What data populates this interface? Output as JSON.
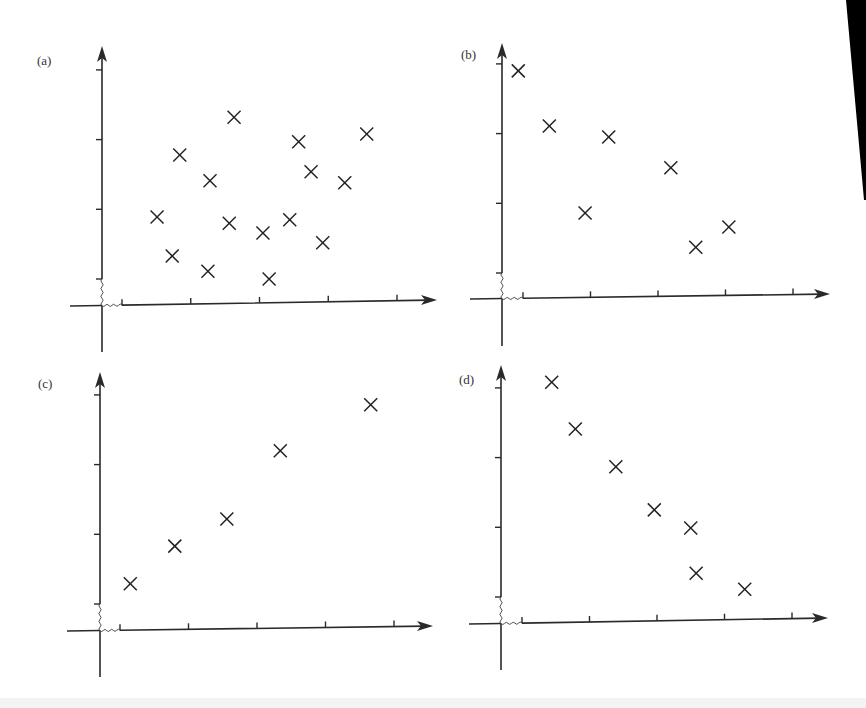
{
  "figure": {
    "edge_shadow": true
  },
  "chart_data": [
    {
      "panel": "(a)",
      "type": "scatter",
      "title": "",
      "xlabel": "",
      "ylabel": "",
      "grid": false,
      "legend": null,
      "x_ticks": [
        0,
        1,
        2,
        3,
        4
      ],
      "y_ticks": [
        0,
        1,
        2,
        3
      ],
      "axis_break": true,
      "xlim": [
        -0.3,
        4.6
      ],
      "ylim": [
        -0.4,
        3.4
      ],
      "marker": "x",
      "points": [
        {
          "x": 0.51,
          "y": 0.89
        },
        {
          "x": 0.84,
          "y": 1.78
        },
        {
          "x": 0.73,
          "y": 0.33
        },
        {
          "x": 1.28,
          "y": 1.41
        },
        {
          "x": 1.25,
          "y": 0.11
        },
        {
          "x": 1.63,
          "y": 2.32
        },
        {
          "x": 1.56,
          "y": 0.8
        },
        {
          "x": 2.05,
          "y": 0.66
        },
        {
          "x": 2.14,
          "y": 0.0
        },
        {
          "x": 2.57,
          "y": 1.97
        },
        {
          "x": 2.75,
          "y": 1.54
        },
        {
          "x": 2.44,
          "y": 0.85
        },
        {
          "x": 2.92,
          "y": 0.52
        },
        {
          "x": 3.24,
          "y": 1.38
        },
        {
          "x": 3.56,
          "y": 2.08
        }
      ]
    },
    {
      "panel": "(b)",
      "type": "scatter",
      "title": "",
      "xlabel": "",
      "ylabel": "",
      "grid": false,
      "legend": null,
      "x_ticks": [
        0,
        1,
        2,
        3,
        4
      ],
      "y_ticks": [
        0,
        1,
        2,
        3
      ],
      "axis_break": true,
      "xlim": [
        -0.3,
        4.6
      ],
      "ylim": [
        -0.4,
        3.4
      ],
      "marker": "x",
      "points": [
        {
          "x": -0.07,
          "y": 2.9
        },
        {
          "x": 0.39,
          "y": 2.11
        },
        {
          "x": 1.27,
          "y": 1.95
        },
        {
          "x": 0.92,
          "y": 0.86
        },
        {
          "x": 2.19,
          "y": 1.51
        },
        {
          "x": 2.56,
          "y": 0.37
        },
        {
          "x": 3.05,
          "y": 0.66
        }
      ]
    },
    {
      "panel": "(c)",
      "type": "scatter",
      "title": "",
      "xlabel": "",
      "ylabel": "",
      "grid": false,
      "legend": null,
      "x_ticks": [
        0,
        1,
        2,
        3,
        4
      ],
      "y_ticks": [
        0,
        1,
        2,
        3
      ],
      "axis_break": true,
      "xlim": [
        -0.3,
        4.6
      ],
      "ylim": [
        -0.4,
        3.4
      ],
      "marker": "x",
      "points": [
        {
          "x": 0.15,
          "y": 0.29
        },
        {
          "x": 0.8,
          "y": 0.83
        },
        {
          "x": 1.56,
          "y": 1.22
        },
        {
          "x": 2.34,
          "y": 2.2
        },
        {
          "x": 3.66,
          "y": 2.86
        }
      ]
    },
    {
      "panel": "(d)",
      "type": "scatter",
      "title": "",
      "xlabel": "",
      "ylabel": "",
      "grid": false,
      "legend": null,
      "x_ticks": [
        0,
        1,
        2,
        3,
        4
      ],
      "y_ticks": [
        0,
        1,
        2,
        3
      ],
      "axis_break": true,
      "xlim": [
        -0.3,
        4.6
      ],
      "ylim": [
        -0.4,
        3.4
      ],
      "marker": "x",
      "points": [
        {
          "x": 0.44,
          "y": 3.08
        },
        {
          "x": 0.79,
          "y": 2.41
        },
        {
          "x": 1.39,
          "y": 1.87
        },
        {
          "x": 1.96,
          "y": 1.25
        },
        {
          "x": 2.5,
          "y": 0.99
        },
        {
          "x": 2.58,
          "y": 0.34
        },
        {
          "x": 3.3,
          "y": 0.11
        }
      ]
    }
  ],
  "panels": [
    {
      "label": "(a)",
      "geom": {
        "ox": 102,
        "oy": 306,
        "x0": 122,
        "dx": 68.75,
        "y0": 279,
        "dy": 69.7,
        "x_end": 437,
        "y_top": 46,
        "y_bottom": 352,
        "x_left": 70,
        "skew": -6,
        "label_x": 37,
        "label_y": 65
      }
    },
    {
      "label": "(b)",
      "geom": {
        "ox": 502,
        "oy": 299,
        "x0": 523,
        "dx": 67.5,
        "y0": 273,
        "dy": 69.7,
        "x_end": 830,
        "y_top": 43,
        "y_bottom": 346,
        "x_left": 470,
        "skew": -5,
        "label_x": 461,
        "label_y": 59
      }
    },
    {
      "label": "(c)",
      "geom": {
        "ox": 100,
        "oy": 631,
        "x0": 120,
        "dx": 68.5,
        "y0": 604,
        "dy": 69.7,
        "x_end": 433,
        "y_top": 372,
        "y_bottom": 677,
        "x_left": 67,
        "skew": -5,
        "label_x": 38,
        "label_y": 388
      }
    },
    {
      "label": "(d)",
      "geom": {
        "ox": 501,
        "oy": 624,
        "x0": 522,
        "dx": 67.5,
        "y0": 597,
        "dy": 69.7,
        "x_end": 828,
        "y_top": 365,
        "y_bottom": 670,
        "x_left": 469,
        "skew": -6,
        "label_x": 459,
        "label_y": 384
      }
    }
  ]
}
